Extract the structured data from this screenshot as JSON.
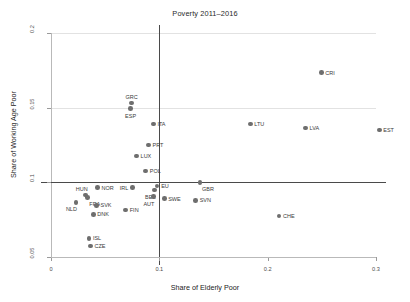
{
  "chart_data": {
    "type": "scatter",
    "title": "Poverty 2011–2016",
    "xlabel": "Share of Elderly Poor",
    "ylabel": "Share of Working Age Poor",
    "xlim": [
      0.0,
      0.3
    ],
    "ylim": [
      0.05,
      0.2
    ],
    "xticks": [
      "0",
      "0.1",
      "0.2",
      "0.3"
    ],
    "xtick_values": [
      0.0,
      0.1,
      0.2,
      0.3
    ],
    "yticks": [
      "0.2",
      "0.15",
      "0.1",
      "0.05"
    ],
    "ytick_values": [
      0.2,
      0.15,
      0.1,
      0.05
    ],
    "grid": "horizontal-light",
    "legend": "none",
    "reference_lines": [
      {
        "axis": "x",
        "value": 0.1
      },
      {
        "axis": "y",
        "value": 0.1
      }
    ],
    "marker_color": "#6e6e6e",
    "points": [
      {
        "label": "CRI",
        "x": 0.2495,
        "y": 0.1735,
        "label_pos": "right"
      },
      {
        "label": "GRC",
        "x": 0.0745,
        "y": 0.153,
        "label_pos": "above"
      },
      {
        "label": "ESP",
        "x": 0.0735,
        "y": 0.1495,
        "label_pos": "below"
      },
      {
        "label": "ITA",
        "x": 0.0945,
        "y": 0.139,
        "label_pos": "right"
      },
      {
        "label": "LTU",
        "x": 0.184,
        "y": 0.139,
        "label_pos": "right"
      },
      {
        "label": "LVA",
        "x": 0.235,
        "y": 0.1365,
        "label_pos": "right"
      },
      {
        "label": "EST",
        "x": 0.303,
        "y": 0.135,
        "label_pos": "right"
      },
      {
        "label": "PRT",
        "x": 0.09,
        "y": 0.125,
        "label_pos": "right"
      },
      {
        "label": "LUX",
        "x": 0.079,
        "y": 0.1175,
        "label_pos": "right"
      },
      {
        "label": "POL",
        "x": 0.0875,
        "y": 0.1075,
        "label_pos": "right"
      },
      {
        "label": "GBR",
        "x": 0.1375,
        "y": 0.1,
        "label_pos": "below-right"
      },
      {
        "label": "EU",
        "x": 0.098,
        "y": 0.0975,
        "label_pos": "right"
      },
      {
        "label": "NOR",
        "x": 0.043,
        "y": 0.0965,
        "label_pos": "right"
      },
      {
        "label": "IRL",
        "x": 0.075,
        "y": 0.0965,
        "label_pos": "left"
      },
      {
        "label": "BEL",
        "x": 0.0955,
        "y": 0.095,
        "label_pos": "below-left"
      },
      {
        "label": "HUN",
        "x": 0.032,
        "y": 0.0915,
        "label_pos": "above-left"
      },
      {
        "label": "AUT",
        "x": 0.0945,
        "y": 0.0905,
        "label_pos": "below-left"
      },
      {
        "label": "SWE",
        "x": 0.1045,
        "y": 0.089,
        "label_pos": "right"
      },
      {
        "label": "FRA",
        "x": 0.0335,
        "y": 0.09,
        "label_pos": "below-right"
      },
      {
        "label": "SVN",
        "x": 0.1335,
        "y": 0.088,
        "label_pos": "right"
      },
      {
        "label": "NLD",
        "x": 0.023,
        "y": 0.0865,
        "label_pos": "below-left"
      },
      {
        "label": "SVK",
        "x": 0.042,
        "y": 0.0845,
        "label_pos": "right"
      },
      {
        "label": "FIN",
        "x": 0.069,
        "y": 0.0815,
        "label_pos": "right"
      },
      {
        "label": "DNK",
        "x": 0.039,
        "y": 0.0785,
        "label_pos": "right"
      },
      {
        "label": "CHE",
        "x": 0.2105,
        "y": 0.0775,
        "label_pos": "right"
      },
      {
        "label": "ISL",
        "x": 0.035,
        "y": 0.0625,
        "label_pos": "right"
      },
      {
        "label": "CZE",
        "x": 0.0365,
        "y": 0.0575,
        "label_pos": "right"
      }
    ]
  }
}
